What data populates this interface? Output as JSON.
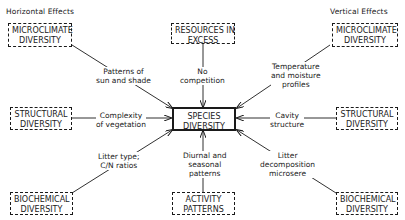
{
  "headers": {
    "left": "Horizontal Effects",
    "right": "Vertical Effects"
  },
  "center": {
    "line1": "SPECIES",
    "line2": "DIVERSITY"
  },
  "boxes": {
    "micro_left": {
      "line1": "MICROCLIMATE",
      "line2": "DIVERSITY"
    },
    "resources": {
      "line1": "RESOURCES IN",
      "line2": "EXCESS"
    },
    "micro_right": {
      "line1": "MICROCLIMATE",
      "line2": "DIVERSITY"
    },
    "struct_left": {
      "line1": "STRUCTURAL",
      "line2": "DIVERSITY"
    },
    "struct_right": {
      "line1": "STRUCTURAL",
      "line2": "DIVERSITY"
    },
    "bio_left": {
      "line1": "BIOCHEMICAL",
      "line2": "DIVERSITY"
    },
    "activity": {
      "line1": "ACTIVITY",
      "line2": "PATTERNS"
    },
    "bio_right": {
      "line1": "BIOCHEMICAL",
      "line2": "DIVERSITY"
    }
  },
  "labels": {
    "sun_shade": {
      "line1": "Patterns of",
      "line2": "sun and shade"
    },
    "competition": {
      "line1": "No",
      "line2": "competition"
    },
    "temperature": {
      "line1": "Temperature",
      "line2": "and moisture",
      "line3": "profiles"
    },
    "complexity": {
      "line1": "Complexity",
      "line2": "of vegetation"
    },
    "cavity": {
      "line1": "Cavity",
      "line2": "structure"
    },
    "litter_type": {
      "line1": "Litter type;",
      "line2": "C/N ratios"
    },
    "diurnal": {
      "line1": "Diurnal and",
      "line2": "seasonal",
      "line3": "patterns"
    },
    "litter_decomp": {
      "line1": "Litter",
      "line2": "decomposition",
      "line3": "microsere"
    }
  },
  "colors": {
    "ink": "#1a1a1a",
    "background": "#ffffff"
  }
}
